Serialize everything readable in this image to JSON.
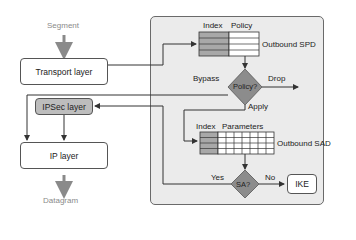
{
  "diagram": {
    "inputs": {
      "top_label": "Segment",
      "bottom_label": "Datagram"
    },
    "layers": {
      "transport": "Transport layer",
      "ipsec": "IPSec layer",
      "ip": "IP layer"
    },
    "spd": {
      "columns": [
        "Index",
        "Policy"
      ],
      "name": "Outbound SPD",
      "rows": 3
    },
    "policy_decision": {
      "label": "Policy?",
      "branches": {
        "left": "Bypass",
        "right": "Drop",
        "down": "Apply"
      }
    },
    "sad": {
      "columns": [
        "Index",
        "Parameters"
      ],
      "name": "Outbound SAD",
      "rows": 3,
      "param_columns": 7
    },
    "sa_decision": {
      "label": "SA?",
      "branches": {
        "left": "Yes",
        "right": "No"
      }
    },
    "ike": "IKE"
  },
  "colors": {
    "panel_bg": "#ebebeb",
    "diamond": "#8c8c8c",
    "index_cell": "#a8a8a8",
    "ipsec_box": "#bdbdbd",
    "line": "#333333",
    "flow_arrow": "#8a8a8a"
  }
}
